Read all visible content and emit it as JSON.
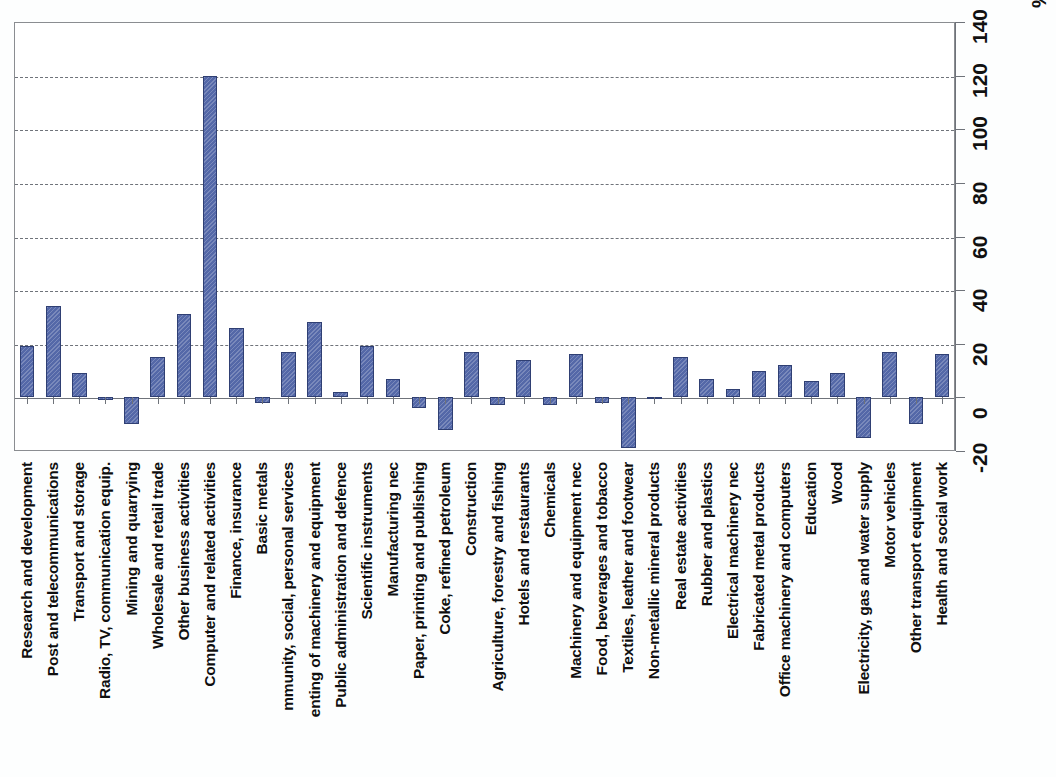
{
  "chart_data": {
    "type": "bar",
    "title": "",
    "subtitle": "",
    "xlabel": "",
    "ylabel": "",
    "unit_label": "%",
    "ylim": [
      -20,
      140
    ],
    "yticks": [
      -20,
      0,
      20,
      40,
      60,
      80,
      100,
      120,
      140
    ],
    "ytick_labels": [
      "-20",
      "0",
      "20",
      "40",
      "60",
      "80",
      "100",
      "120",
      "140"
    ],
    "grid": true,
    "gridlines_at": [
      20,
      40,
      60,
      80,
      100,
      120
    ],
    "legend": [],
    "legend_position": "none",
    "bar_color": "#5468a8",
    "bar_edge_color": "#2f3f73",
    "categories": [
      "Research and development",
      "Post and telecommunications",
      "Transport and storage",
      "Radio, TV, communication equip.",
      "Mining and quarrying",
      "Wholesale and retail trade",
      "Other business activities",
      "Computer and related activities",
      "Finance, insurance",
      "Basic metals",
      "mmunity, social, personal services",
      "enting of machinery and equipment",
      "Public administration and defence",
      "Scientific instruments",
      "Manufacturing nec",
      "Paper, printing and publishing",
      "Coke, refined petroleum",
      "Construction",
      "Agriculture, forestry and fishing",
      "Hotels and restaurants",
      "Chemicals",
      "Machinery and equipment nec",
      "Food, beverages and tobacco",
      "Textiles, leather and footwear",
      "Non-metallic mineral products",
      "Real estate activities",
      "Rubber and plastics",
      "Electrical machinery nec",
      "Fabricated metal products",
      "Office machinery and computers",
      "Education",
      "Wood",
      "Electricity, gas and water supply",
      "Motor vehicles",
      "Other transport equipment",
      "Health and social work"
    ],
    "values": [
      19,
      34,
      9,
      -1,
      -10,
      15,
      31,
      120,
      26,
      -2,
      17,
      28,
      2,
      19,
      7,
      -4,
      -12,
      17,
      -3,
      14,
      -3,
      16,
      -2,
      -19,
      0,
      15,
      7,
      3,
      10,
      12,
      6,
      9,
      -15,
      17,
      -10,
      16
    ]
  }
}
